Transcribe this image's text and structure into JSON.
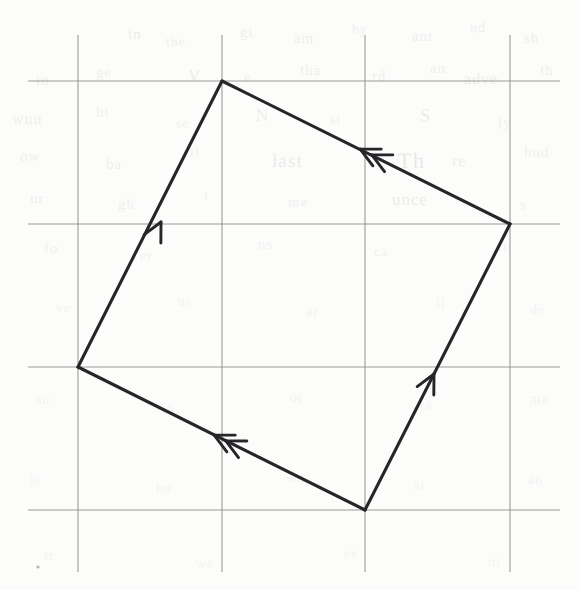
{
  "figure": {
    "medium": "pencil on grid-ruled paper",
    "width": 580,
    "height": 590
  },
  "colors": {
    "paper": "#fcfcfb",
    "grid_line": "#8a8a8a",
    "figure_line": "#26262a",
    "arrow_line": "#26262a",
    "bleed_text": "#6b6258"
  },
  "grid": {
    "label": "grid",
    "line_color": "#8a8a8a",
    "line_width": 1.1,
    "vertical_x": [
      78,
      222,
      365,
      510
    ],
    "vertical_span": [
      35,
      572
    ],
    "horizontal_y": [
      81,
      224,
      367,
      510
    ],
    "horizontal_span": [
      28,
      560
    ],
    "cell_width": 144,
    "cell_height": 143
  },
  "shape": {
    "name": "parallelogram",
    "kind": "rotated-square",
    "closed": true,
    "stroke_width": 3.1,
    "stroke_color": "#26262a",
    "vertices": [
      {
        "name": "top-vertex",
        "x": 222,
        "y": 81,
        "grid": "col1,row0"
      },
      {
        "name": "right-vertex",
        "x": 510,
        "y": 224,
        "grid": "col3,row1"
      },
      {
        "name": "bottom-vertex",
        "x": 365,
        "y": 510,
        "grid": "col2,row3"
      },
      {
        "name": "left-vertex",
        "x": 78,
        "y": 367,
        "grid": "col0,row2"
      }
    ]
  },
  "edges": [
    {
      "name": "left-edge",
      "from": "left-vertex",
      "to": "top-vertex",
      "x1": 78,
      "y1": 367,
      "x2": 222,
      "y2": 81,
      "arrow_count": 1,
      "arrow_direction": "up-right",
      "arrow_at": {
        "x": 161,
        "y": 222
      },
      "marking": "single tick arrow"
    },
    {
      "name": "top-right-edge",
      "from": "right-vertex",
      "to": "top-vertex",
      "x1": 510,
      "y1": 224,
      "x2": 222,
      "y2": 81,
      "arrow_count": 2,
      "arrow_direction": "up-left",
      "arrow_at": {
        "x": 366,
        "y": 152
      },
      "marking": "double tick arrow"
    },
    {
      "name": "right-edge",
      "from": "bottom-vertex",
      "to": "right-vertex",
      "x1": 365,
      "y1": 510,
      "x2": 510,
      "y2": 224,
      "arrow_count": 1,
      "arrow_direction": "up-right",
      "arrow_at": {
        "x": 434,
        "y": 374
      },
      "marking": "single tick arrow"
    },
    {
      "name": "bottom-left-edge",
      "from": "bottom-vertex",
      "to": "left-vertex",
      "x1": 365,
      "y1": 510,
      "x2": 78,
      "y2": 367,
      "arrow_count": 2,
      "arrow_direction": "up-left",
      "arrow_at": {
        "x": 220,
        "y": 438
      },
      "marking": "double tick arrow"
    }
  ],
  "bleed_through": {
    "note": "faint illegible text showing through from the reverse side of the page",
    "legible": false,
    "fragments": [
      {
        "text": "in",
        "x": 128,
        "y": 26,
        "size": 15,
        "rotate": -1.5,
        "opacity": 0.1
      },
      {
        "text": "the",
        "x": 166,
        "y": 34,
        "size": 14,
        "rotate": 0.5,
        "opacity": 0.08
      },
      {
        "text": "gi",
        "x": 240,
        "y": 24,
        "size": 15,
        "rotate": -1,
        "opacity": 0.09
      },
      {
        "text": "am",
        "x": 294,
        "y": 30,
        "size": 15,
        "rotate": 1,
        "opacity": 0.09
      },
      {
        "text": "by",
        "x": 352,
        "y": 22,
        "size": 14,
        "rotate": -0.5,
        "opacity": 0.08
      },
      {
        "text": "ant",
        "x": 412,
        "y": 28,
        "size": 15,
        "rotate": 0.5,
        "opacity": 0.09
      },
      {
        "text": "nd",
        "x": 470,
        "y": 20,
        "size": 14,
        "rotate": -1,
        "opacity": 0.08
      },
      {
        "text": "sh",
        "x": 524,
        "y": 30,
        "size": 15,
        "rotate": 1,
        "opacity": 0.09
      },
      {
        "text": "in",
        "x": 36,
        "y": 72,
        "size": 15,
        "rotate": 0.5,
        "opacity": 0.09
      },
      {
        "text": "ge",
        "x": 96,
        "y": 64,
        "size": 15,
        "rotate": -1,
        "opacity": 0.08
      },
      {
        "text": "V",
        "x": 188,
        "y": 66,
        "size": 17,
        "rotate": 0.5,
        "opacity": 0.1
      },
      {
        "text": "e",
        "x": 244,
        "y": 70,
        "size": 14,
        "rotate": 0,
        "opacity": 0.08
      },
      {
        "text": "tha",
        "x": 300,
        "y": 62,
        "size": 15,
        "rotate": 1,
        "opacity": 0.09
      },
      {
        "text": "rd",
        "x": 372,
        "y": 68,
        "size": 15,
        "rotate": -0.5,
        "opacity": 0.09
      },
      {
        "text": "an",
        "x": 430,
        "y": 60,
        "size": 15,
        "rotate": 0.5,
        "opacity": 0.09
      },
      {
        "text": "adve",
        "x": 464,
        "y": 70,
        "size": 16,
        "rotate": -1,
        "opacity": 0.1
      },
      {
        "text": "th",
        "x": 540,
        "y": 62,
        "size": 15,
        "rotate": 0,
        "opacity": 0.08
      },
      {
        "text": "wuu",
        "x": 12,
        "y": 110,
        "size": 16,
        "rotate": 1,
        "opacity": 0.09
      },
      {
        "text": "ht",
        "x": 96,
        "y": 104,
        "size": 15,
        "rotate": -0.5,
        "opacity": 0.08
      },
      {
        "text": "se",
        "x": 176,
        "y": 116,
        "size": 14,
        "rotate": 0.5,
        "opacity": 0.08
      },
      {
        "text": "N",
        "x": 256,
        "y": 106,
        "size": 17,
        "rotate": -1,
        "opacity": 0.09
      },
      {
        "text": "st",
        "x": 330,
        "y": 112,
        "size": 14,
        "rotate": 0.5,
        "opacity": 0.08
      },
      {
        "text": "S",
        "x": 420,
        "y": 106,
        "size": 18,
        "rotate": 0,
        "opacity": 0.1
      },
      {
        "text": "ly",
        "x": 498,
        "y": 114,
        "size": 15,
        "rotate": 1,
        "opacity": 0.08
      },
      {
        "text": "ow",
        "x": 20,
        "y": 148,
        "size": 15,
        "rotate": -1,
        "opacity": 0.08
      },
      {
        "text": "ba",
        "x": 106,
        "y": 156,
        "size": 15,
        "rotate": 0.5,
        "opacity": 0.09
      },
      {
        "text": "rl",
        "x": 190,
        "y": 144,
        "size": 14,
        "rotate": -0.5,
        "opacity": 0.08
      },
      {
        "text": "last",
        "x": 272,
        "y": 150,
        "size": 19,
        "rotate": 0.5,
        "opacity": 0.11
      },
      {
        "text": "Th",
        "x": 398,
        "y": 148,
        "size": 22,
        "rotate": -1,
        "opacity": 0.12
      },
      {
        "text": "re",
        "x": 452,
        "y": 152,
        "size": 16,
        "rotate": 0.5,
        "opacity": 0.09
      },
      {
        "text": "hud",
        "x": 524,
        "y": 144,
        "size": 15,
        "rotate": 0,
        "opacity": 0.08
      },
      {
        "text": "ur",
        "x": 30,
        "y": 190,
        "size": 15,
        "rotate": 1,
        "opacity": 0.08
      },
      {
        "text": "gh",
        "x": 118,
        "y": 196,
        "size": 15,
        "rotate": -0.5,
        "opacity": 0.08
      },
      {
        "text": "t",
        "x": 204,
        "y": 188,
        "size": 14,
        "rotate": 0.5,
        "opacity": 0.07
      },
      {
        "text": "me",
        "x": 288,
        "y": 194,
        "size": 15,
        "rotate": -1,
        "opacity": 0.08
      },
      {
        "text": "unce",
        "x": 392,
        "y": 190,
        "size": 17,
        "rotate": 0.5,
        "opacity": 0.1
      },
      {
        "text": "s",
        "x": 520,
        "y": 196,
        "size": 16,
        "rotate": 0,
        "opacity": 0.08
      },
      {
        "text": "fo",
        "x": 44,
        "y": 240,
        "size": 15,
        "rotate": -0.5,
        "opacity": 0.07
      },
      {
        "text": "er",
        "x": 140,
        "y": 248,
        "size": 14,
        "rotate": 1,
        "opacity": 0.07
      },
      {
        "text": "ns",
        "x": 258,
        "y": 236,
        "size": 15,
        "rotate": -1,
        "opacity": 0.07
      },
      {
        "text": "ca",
        "x": 374,
        "y": 244,
        "size": 14,
        "rotate": 0.5,
        "opacity": 0.07
      },
      {
        "text": "to",
        "x": 498,
        "y": 238,
        "size": 15,
        "rotate": 0,
        "opacity": 0.07
      },
      {
        "text": "ve",
        "x": 56,
        "y": 300,
        "size": 14,
        "rotate": 0.5,
        "opacity": 0.06
      },
      {
        "text": "nt",
        "x": 178,
        "y": 294,
        "size": 14,
        "rotate": -1,
        "opacity": 0.06
      },
      {
        "text": "ar",
        "x": 306,
        "y": 304,
        "size": 14,
        "rotate": 0.5,
        "opacity": 0.06
      },
      {
        "text": "li",
        "x": 436,
        "y": 296,
        "size": 14,
        "rotate": 0,
        "opacity": 0.06
      },
      {
        "text": "de",
        "x": 530,
        "y": 302,
        "size": 14,
        "rotate": -0.5,
        "opacity": 0.06
      },
      {
        "text": "su",
        "x": 36,
        "y": 392,
        "size": 14,
        "rotate": 1,
        "opacity": 0.06
      },
      {
        "text": "in",
        "x": 162,
        "y": 400,
        "size": 14,
        "rotate": -0.5,
        "opacity": 0.06
      },
      {
        "text": "ot",
        "x": 290,
        "y": 390,
        "size": 14,
        "rotate": 0.5,
        "opacity": 0.06
      },
      {
        "text": "ra",
        "x": 420,
        "y": 398,
        "size": 14,
        "rotate": -1,
        "opacity": 0.06
      },
      {
        "text": "me",
        "x": 530,
        "y": 392,
        "size": 14,
        "rotate": 0,
        "opacity": 0.06
      },
      {
        "text": "le",
        "x": 30,
        "y": 472,
        "size": 14,
        "rotate": -0.5,
        "opacity": 0.06
      },
      {
        "text": "ho",
        "x": 156,
        "y": 480,
        "size": 14,
        "rotate": 0.5,
        "opacity": 0.06
      },
      {
        "text": "wn",
        "x": 286,
        "y": 470,
        "size": 14,
        "rotate": -1,
        "opacity": 0.06
      },
      {
        "text": "si",
        "x": 414,
        "y": 478,
        "size": 14,
        "rotate": 0.5,
        "opacity": 0.06
      },
      {
        "text": "an",
        "x": 528,
        "y": 472,
        "size": 14,
        "rotate": 0,
        "opacity": 0.06
      },
      {
        "text": "tr",
        "x": 44,
        "y": 548,
        "size": 14,
        "rotate": 1,
        "opacity": 0.05
      },
      {
        "text": "we",
        "x": 196,
        "y": 556,
        "size": 14,
        "rotate": -0.5,
        "opacity": 0.05
      },
      {
        "text": "ce",
        "x": 344,
        "y": 546,
        "size": 14,
        "rotate": 0.5,
        "opacity": 0.05
      },
      {
        "text": "ni",
        "x": 488,
        "y": 554,
        "size": 14,
        "rotate": -1,
        "opacity": 0.05
      }
    ]
  },
  "speck": {
    "name": "paper-speck",
    "x": 38,
    "y": 567,
    "r": 1.6
  }
}
